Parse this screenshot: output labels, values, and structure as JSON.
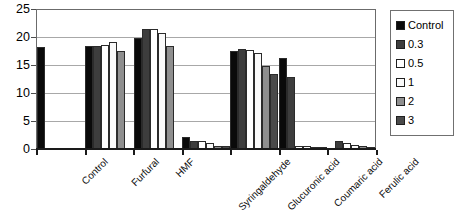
{
  "chart_data": {
    "type": "bar",
    "title": "",
    "subtitle": "",
    "xlabel": "",
    "ylabel": "",
    "ylim": [
      0,
      25
    ],
    "yticks": [
      0,
      5,
      10,
      15,
      20,
      25
    ],
    "ytick_labels": [
      "0",
      "5",
      "10",
      "15",
      "20",
      "25"
    ],
    "grid": true,
    "grid_axis": "y",
    "legend_position": "right",
    "categories": [
      "Control",
      "Furfural",
      "HMF",
      "Syringaldehyde",
      "Glucuronic acid",
      "Coumaric acid",
      "Ferulic acid"
    ],
    "series": [
      {
        "name": "Control",
        "color": "#0a0a0a",
        "values": [
          18.1,
          18.2,
          19.6,
          2.0,
          17.4,
          16.0,
          0.0
        ]
      },
      {
        "name": "0.3",
        "color": "#3d3d3d",
        "values": [
          0.0,
          18.3,
          21.3,
          1.3,
          17.6,
          12.6,
          1.3
        ]
      },
      {
        "name": "0.5",
        "color": "#ffffff",
        "values": [
          0.0,
          18.4,
          21.3,
          1.2,
          17.5,
          0.4,
          0.9
        ]
      },
      {
        "name": "1",
        "color": "#fafafa",
        "values": [
          0.0,
          18.9,
          20.5,
          0.9,
          17.0,
          0.3,
          0.5
        ]
      },
      {
        "name": "2",
        "color": "#8f8f8f",
        "values": [
          0.0,
          17.3,
          18.2,
          0.4,
          14.6,
          0.2,
          0.3
        ]
      },
      {
        "name": "3",
        "color": "#4a4a4a",
        "values": [
          0.0,
          0.0,
          0.0,
          0.3,
          13.2,
          0.2,
          0.2
        ]
      }
    ]
  },
  "legend": {
    "items": [
      {
        "label": "Control",
        "swatch": "s-control"
      },
      {
        "label": "0.3",
        "swatch": "s-03"
      },
      {
        "label": "0.5",
        "swatch": "s-05"
      },
      {
        "label": "1",
        "swatch": "s-1"
      },
      {
        "label": "2",
        "swatch": "s-2"
      },
      {
        "label": "3",
        "swatch": "s-3"
      }
    ]
  }
}
